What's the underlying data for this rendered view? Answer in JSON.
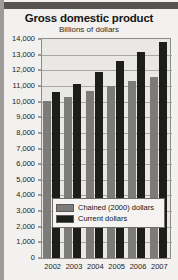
{
  "chart_data": {
    "type": "bar",
    "title": "Gross domestic product",
    "subtitle": "Billions of dollars",
    "xlabel": "",
    "ylabel": "",
    "categories": [
      "2002",
      "2003",
      "2004",
      "2005",
      "2006",
      "2007"
    ],
    "series": [
      {
        "name": "Chained (2000) dollars",
        "color": "#7c7b78",
        "values": [
          10050,
          10300,
          10700,
          11000,
          11300,
          11550
        ]
      },
      {
        "name": "Current dollars",
        "color": "#1d1d1c",
        "values": [
          10600,
          11100,
          11900,
          12600,
          13200,
          13800
        ]
      }
    ],
    "ylim": [
      0,
      14000
    ],
    "ytick_values": [
      0,
      1000,
      2000,
      3000,
      4000,
      5000,
      6000,
      7000,
      8000,
      9000,
      10000,
      11000,
      12000,
      13000,
      14000
    ],
    "ytick_labels": [
      "0",
      "1,000",
      "2,000",
      "3,000",
      "4,000",
      "5,000",
      "6,000",
      "7,000",
      "8,000",
      "9,000",
      "10,000",
      "11,000",
      "12,000",
      "13,000",
      "14,000"
    ],
    "grid": true,
    "legend_position": "inside-bottom-center"
  },
  "colors": {
    "background": "#f2f1ef",
    "plot_background": "#e9e8e5",
    "header_bar": "#555452",
    "axis": "#8d8c89",
    "gridline": "#a8a7a4",
    "text": "#1c1c1c"
  }
}
